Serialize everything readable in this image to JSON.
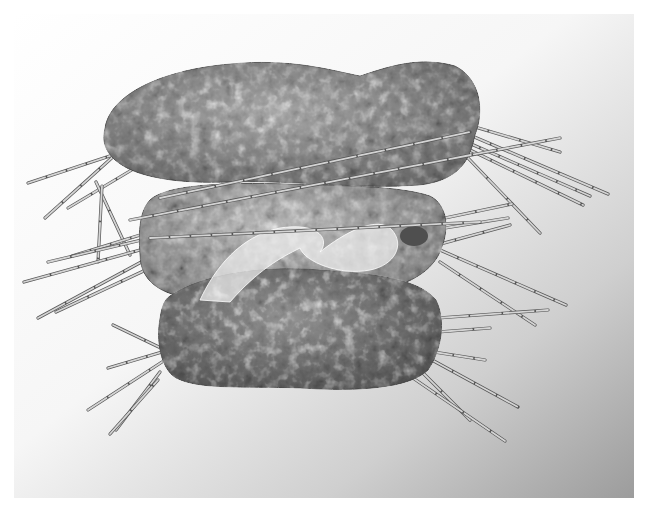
{
  "image": {
    "width": 657,
    "height": 520,
    "subject": "three stacked grayscale fiber-art pillow forms pierced with thin sticks",
    "palette": {
      "page": "#ffffff",
      "backdrop_light": "#fbfbfb",
      "backdrop_dark": "#9c9c9c",
      "pillow_top": "#8a8a8a",
      "pillow_mid": "#a2a2a2",
      "pillow_bottom": "#6e6e6e",
      "organza": "#e8e8e8",
      "stick_light": "#d4d4d4",
      "stick_dark": "#555555"
    }
  },
  "backdrop": {
    "x": 14,
    "y": 14,
    "w": 620,
    "h": 484
  },
  "pillows": [
    {
      "name": "top-pillow",
      "path": "M105,128 C110,95 160,70 230,64 C290,58 330,70 360,76 C390,66 420,56 455,66 C480,78 485,110 475,135 C470,160 460,180 420,185 C360,190 300,180 230,182 C180,184 135,178 115,160 C104,150 102,140 105,128 Z",
      "fill": "#8c8c8c"
    },
    {
      "name": "middle-pillow",
      "path": "M150,200 C165,185 220,182 290,184 C350,186 400,186 430,196 C448,205 450,230 440,252 C430,275 400,290 360,292 C300,296 240,300 195,298 C160,296 140,280 140,255 C138,230 140,210 150,200 Z",
      "fill": "#a6a6a6"
    },
    {
      "name": "bottom-pillow",
      "path": "M170,296 C200,275 260,265 320,270 C380,274 420,280 436,300 C446,320 442,350 428,370 C410,388 360,392 300,388 C240,386 200,390 176,378 C160,368 156,340 160,318 C162,306 164,300 170,296 Z",
      "fill": "#707070"
    }
  ],
  "organza": {
    "path": "M200,300 C215,268 240,236 280,228 C320,222 330,240 320,252 C345,232 378,215 392,230 C405,245 395,265 370,270 C340,276 305,262 300,248 C280,258 258,270 230,302 Z",
    "fill": "#eeeeee",
    "opacity": 0.72
  },
  "nodule": {
    "cx": 414,
    "cy": 236,
    "rx": 14,
    "ry": 10,
    "fill": "#4f4f4f"
  },
  "sticks": [
    {
      "x1": 28,
      "y1": 183,
      "x2": 128,
      "y2": 150
    },
    {
      "x1": 45,
      "y1": 218,
      "x2": 115,
      "y2": 155
    },
    {
      "x1": 68,
      "y1": 208,
      "x2": 140,
      "y2": 165
    },
    {
      "x1": 96,
      "y1": 182,
      "x2": 130,
      "y2": 255
    },
    {
      "x1": 102,
      "y1": 186,
      "x2": 98,
      "y2": 262
    },
    {
      "x1": 72,
      "y1": 256,
      "x2": 150,
      "y2": 232
    },
    {
      "x1": 48,
      "y1": 262,
      "x2": 150,
      "y2": 238
    },
    {
      "x1": 24,
      "y1": 282,
      "x2": 140,
      "y2": 250
    },
    {
      "x1": 38,
      "y1": 318,
      "x2": 145,
      "y2": 260
    },
    {
      "x1": 56,
      "y1": 312,
      "x2": 150,
      "y2": 268
    },
    {
      "x1": 150,
      "y1": 238,
      "x2": 480,
      "y2": 222
    },
    {
      "x1": 130,
      "y1": 220,
      "x2": 560,
      "y2": 138
    },
    {
      "x1": 160,
      "y1": 198,
      "x2": 470,
      "y2": 132
    },
    {
      "x1": 458,
      "y1": 122,
      "x2": 560,
      "y2": 152
    },
    {
      "x1": 458,
      "y1": 130,
      "x2": 608,
      "y2": 194
    },
    {
      "x1": 462,
      "y1": 140,
      "x2": 590,
      "y2": 196
    },
    {
      "x1": 470,
      "y1": 150,
      "x2": 583,
      "y2": 205
    },
    {
      "x1": 468,
      "y1": 158,
      "x2": 540,
      "y2": 233
    },
    {
      "x1": 445,
      "y1": 218,
      "x2": 512,
      "y2": 204
    },
    {
      "x1": 445,
      "y1": 228,
      "x2": 508,
      "y2": 218
    },
    {
      "x1": 440,
      "y1": 250,
      "x2": 566,
      "y2": 305
    },
    {
      "x1": 440,
      "y1": 262,
      "x2": 535,
      "y2": 325
    },
    {
      "x1": 345,
      "y1": 270,
      "x2": 510,
      "y2": 225
    },
    {
      "x1": 438,
      "y1": 318,
      "x2": 548,
      "y2": 310
    },
    {
      "x1": 438,
      "y1": 332,
      "x2": 490,
      "y2": 328
    },
    {
      "x1": 434,
      "y1": 352,
      "x2": 485,
      "y2": 360
    },
    {
      "x1": 432,
      "y1": 360,
      "x2": 518,
      "y2": 407
    },
    {
      "x1": 422,
      "y1": 372,
      "x2": 470,
      "y2": 420
    },
    {
      "x1": 410,
      "y1": 376,
      "x2": 505,
      "y2": 441
    },
    {
      "x1": 113,
      "y1": 325,
      "x2": 165,
      "y2": 350
    },
    {
      "x1": 108,
      "y1": 368,
      "x2": 162,
      "y2": 352
    },
    {
      "x1": 88,
      "y1": 410,
      "x2": 162,
      "y2": 362
    },
    {
      "x1": 116,
      "y1": 430,
      "x2": 160,
      "y2": 372
    },
    {
      "x1": 110,
      "y1": 434,
      "x2": 158,
      "y2": 380
    }
  ]
}
